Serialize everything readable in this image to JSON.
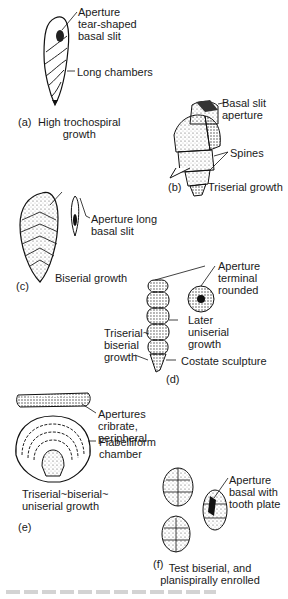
{
  "figure": {
    "panels": [
      {
        "id": "a",
        "tag": "(a)",
        "title_line1": "High trochospiral",
        "title_line2": "growth",
        "labels": [
          {
            "line1": "Aperture",
            "line2": "tear-shaped",
            "line3": "basal slit"
          },
          {
            "line1": "Long chambers"
          }
        ]
      },
      {
        "id": "b",
        "tag": "(b)",
        "title_line1": "Triserial growth",
        "labels": [
          {
            "line1": "Basal slit",
            "line2": "aperture"
          },
          {
            "line1": "Spines"
          }
        ]
      },
      {
        "id": "c",
        "tag": "(c)",
        "title_line1": "Biserial growth",
        "labels": [
          {
            "line1": "Aperture long",
            "line2": "basal slit"
          }
        ]
      },
      {
        "id": "d",
        "tag": "(d)",
        "labels": [
          {
            "line1": "Aperture",
            "line2": "terminal",
            "line3": "rounded"
          },
          {
            "line1": "Later",
            "line2": "uniserial",
            "line3": "growth"
          },
          {
            "line1": "Triserial~",
            "line2": "biserial",
            "line3": "growth"
          },
          {
            "line1": "Costate sculpture"
          }
        ]
      },
      {
        "id": "e",
        "tag": "(e)",
        "title_line1": "Triserial~biserial~",
        "title_line2": "uniserial growth",
        "labels": [
          {
            "line1": "Apertures",
            "line2": "cribrate,",
            "line3": "peripheral"
          },
          {
            "line1": "Flabelliform",
            "line2": "chamber"
          }
        ]
      },
      {
        "id": "f",
        "tag": "(f)",
        "title_line1": "Test biserial, and",
        "title_line2": "planispirally enrolled",
        "labels": [
          {
            "line1": "Aperture",
            "line2": "basal with",
            "line3": "tooth plate"
          }
        ]
      }
    ]
  }
}
